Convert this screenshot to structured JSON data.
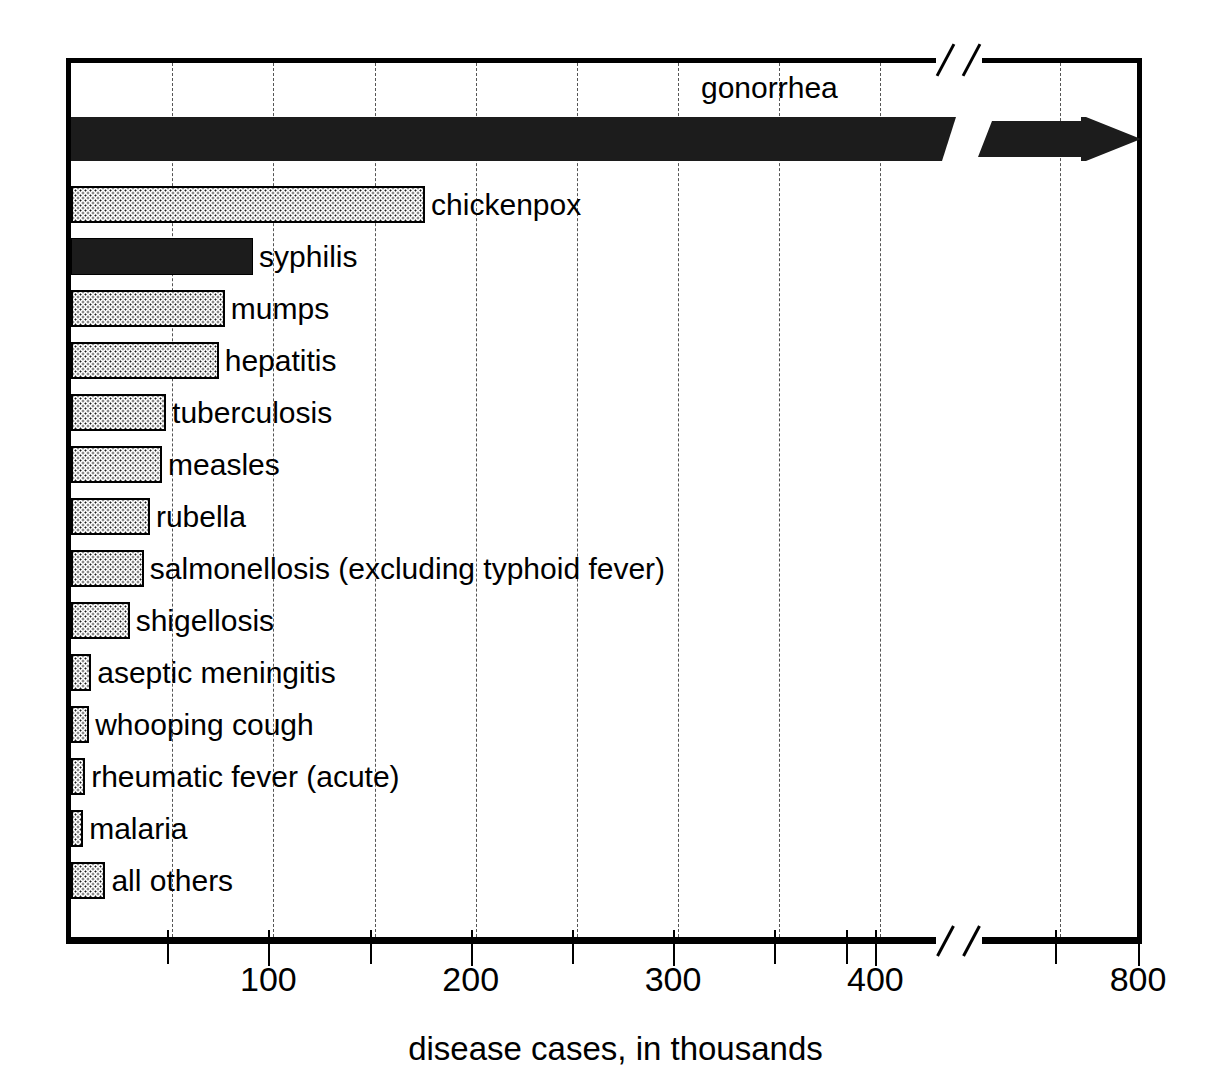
{
  "chart_data": {
    "type": "bar",
    "orientation": "horizontal",
    "title": "",
    "xlabel": "disease cases, in thousands",
    "ylabel": "",
    "categories": [
      "gonorrhea",
      "chickenpox",
      "syphilis",
      "mumps",
      "hepatitis",
      "tuberculosis",
      "measles",
      "rubella",
      "salmonellosis (excluding typhoid fever)",
      "shigellosis",
      "aseptic meningitis",
      "whooping cough",
      "rheumatic fever (acute)",
      "malaria",
      "all others"
    ],
    "values": [
      800,
      175,
      90,
      76,
      73,
      47,
      45,
      39,
      36,
      29,
      10,
      9,
      7,
      6,
      17
    ],
    "value_note": "gonorrhea bar is clipped by an axis break at 425 and continues with an arrow to 800",
    "xlim": [
      0,
      800
    ],
    "axis_break": {
      "from": 425,
      "to": 600
    },
    "tick_labels": [
      "100",
      "200",
      "300",
      "400",
      "800"
    ],
    "tick_values": [
      100,
      200,
      300,
      400,
      800
    ],
    "minor_tick_values": [
      50,
      150,
      250,
      350,
      450,
      700
    ],
    "grid": true,
    "grid_style": "dashed vertical",
    "legend": "none",
    "bar_styles": {
      "stipple": "dotted light fill with black outline",
      "solid": "solid black fill"
    },
    "series_fill": [
      "solid",
      "stipple",
      "solid",
      "stipple",
      "stipple",
      "stipple",
      "stipple",
      "stipple",
      "stipple",
      "stipple",
      "stipple",
      "stipple",
      "stipple",
      "stipple",
      "stipple"
    ],
    "colors": {
      "solid_bar": "#1c1c1c",
      "stipple_dot": "#1a1a1a",
      "stipple_background": "#ffffff",
      "frame": "#000000",
      "gridline": "#555555",
      "text": "#000000",
      "page_background": "#ffffff"
    }
  },
  "axis": {
    "title": "disease cases, in thousands",
    "ticks": [
      {
        "label": "100",
        "value": 100
      },
      {
        "label": "200",
        "value": 200
      },
      {
        "label": "300",
        "value": 300
      },
      {
        "label": "400",
        "value": 400
      },
      {
        "label": "800",
        "value": 800
      }
    ]
  },
  "bars": [
    {
      "label": "gonorrhea",
      "value": 800,
      "fill": "solid",
      "label_position": "above-centered"
    },
    {
      "label": "chickenpox",
      "value": 175,
      "fill": "stipple",
      "label_position": "right"
    },
    {
      "label": "syphilis",
      "value": 90,
      "fill": "solid",
      "label_position": "right"
    },
    {
      "label": "mumps",
      "value": 76,
      "fill": "stipple",
      "label_position": "right"
    },
    {
      "label": "hepatitis",
      "value": 73,
      "fill": "stipple",
      "label_position": "right"
    },
    {
      "label": "tuberculosis",
      "value": 47,
      "fill": "stipple",
      "label_position": "right"
    },
    {
      "label": "measles",
      "value": 45,
      "fill": "stipple",
      "label_position": "right"
    },
    {
      "label": "rubella",
      "value": 39,
      "fill": "stipple",
      "label_position": "right"
    },
    {
      "label": "salmonellosis (excluding typhoid fever)",
      "value": 36,
      "fill": "stipple",
      "label_position": "right"
    },
    {
      "label": "shigellosis",
      "value": 29,
      "fill": "stipple",
      "label_position": "right"
    },
    {
      "label": "aseptic meningitis",
      "value": 10,
      "fill": "stipple",
      "label_position": "right"
    },
    {
      "label": "whooping cough",
      "value": 9,
      "fill": "stipple",
      "label_position": "right"
    },
    {
      "label": "rheumatic fever (acute)",
      "value": 7,
      "fill": "stipple",
      "label_position": "right"
    },
    {
      "label": "malaria",
      "value": 6,
      "fill": "stipple",
      "label_position": "right"
    },
    {
      "label": "all others",
      "value": 17,
      "fill": "stipple",
      "label_position": "right"
    }
  ]
}
